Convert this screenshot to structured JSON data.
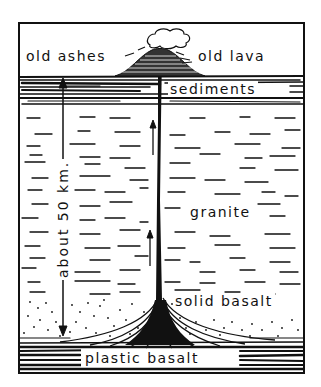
{
  "diagram": {
    "type": "volcano cross-section",
    "labels": {
      "old_ashes": "old ashes",
      "old_lava": "old lava",
      "sediments": "sediments",
      "granite": "granite",
      "solid_basalt": "solid basalt",
      "plastic_basalt": "plastic basalt",
      "depth": "about 50 km."
    },
    "layers": [
      "sediments",
      "granite",
      "solid basalt",
      "plastic basalt"
    ],
    "colors": {
      "ink": "#111111",
      "paper": "#ffffff"
    }
  }
}
